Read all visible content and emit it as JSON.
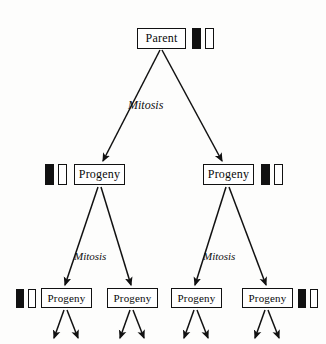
{
  "diagram": {
    "colors": {
      "stroke": "#111111",
      "background": "#fdfdfc",
      "chromosome_dark": "#111111",
      "chromosome_light": "#ffffff"
    },
    "nodes": {
      "parent": {
        "label": "Parent"
      },
      "mid_left": {
        "label": "Progeny"
      },
      "mid_right": {
        "label": "Progeny"
      },
      "leaf_a": {
        "label": "Progeny"
      },
      "leaf_b": {
        "label": "Progeny"
      },
      "leaf_c": {
        "label": "Progeny"
      },
      "leaf_d": {
        "label": "Progeny"
      }
    },
    "labels": {
      "mitosis_top": "Mitosis",
      "mitosis_bottom_left": "Mitosis",
      "mitosis_bottom_right": "Mitosis"
    },
    "chromosome_pairs": [
      {
        "owner": "parent",
        "side": "right",
        "bars": [
          "dark",
          "light"
        ]
      },
      {
        "owner": "mid_left",
        "side": "left",
        "bars": [
          "dark",
          "light"
        ]
      },
      {
        "owner": "mid_right",
        "side": "right",
        "bars": [
          "dark",
          "light"
        ]
      },
      {
        "owner": "leaf_a",
        "side": "left",
        "bars": [
          "dark",
          "light"
        ]
      },
      {
        "owner": "leaf_d",
        "side": "right",
        "bars": [
          "dark",
          "light"
        ]
      }
    ]
  }
}
